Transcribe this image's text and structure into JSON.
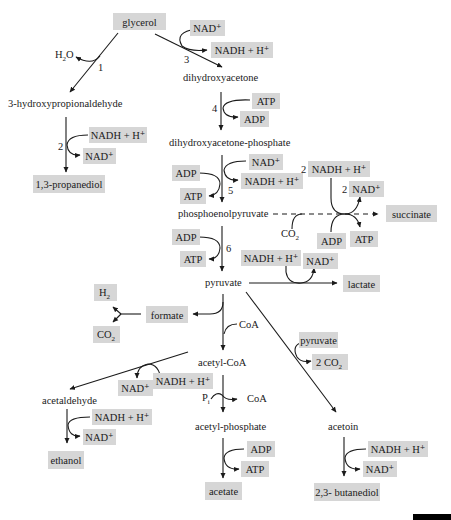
{
  "diagram": {
    "colors": {
      "box_fill": "#d6d6d6",
      "line": "#1a1a1a",
      "background": "#ffffff",
      "scale_bar": "#000000"
    },
    "nodes": {
      "glycerol": "glycerol",
      "hpa": "3-hydroxypropionaldehyde",
      "propanediol": "1,3-propanediol",
      "dha": "dihydroxyacetone",
      "dhap": "dihydroxyacetone-phosphate",
      "pep": "phosphoenolpyruvate",
      "succinate": "succinate",
      "pyruvate": "pyruvate",
      "lactate": "lactate",
      "formate": "formate",
      "h2": "H",
      "h2_sub": "2",
      "co2_formate": "CO",
      "co2_formate_sub": "2",
      "acetyl_coa": "acetyl-CoA",
      "acetaldehyde": "acetaldehyde",
      "ethanol": "ethanol",
      "acetyl_phosphate": "acetyl-phosphate",
      "acetate": "acetate",
      "acetoin": "acetoin",
      "butanediol": "2,3- butanediol"
    },
    "cofactors": {
      "h2o": "H",
      "h2o_sub": "2",
      "h2o_o": "O",
      "r2_in": "NADH + H⁺",
      "r2_out": "NAD⁺",
      "r3_in": "NAD⁺",
      "r3_out": "NADH + H⁺",
      "r4_in": "ATP",
      "r4_out": "ADP",
      "r5_nad_in": "NAD⁺",
      "r5_nadh_out": "NADH + H⁺",
      "r5_adp_in": "ADP",
      "r5_atp_out": "ATP",
      "succ_nadh": "NADH + H⁺",
      "succ_nadh_coef": "2",
      "succ_nad": "NAD⁺",
      "succ_nad_coef": "2",
      "succ_co2": "CO",
      "succ_co2_sub": "2",
      "succ_adp": "ADP",
      "succ_atp": "ATP",
      "r6_adp": "ADP",
      "r6_atp": "ATP",
      "lac_nadh": "NADH + H⁺",
      "lac_nad": "NAD⁺",
      "coa_in": "CoA",
      "acald_nadh": "NADH + H⁺",
      "acald_nad": "NAD⁺",
      "pi": "P",
      "pi_sub": "i",
      "coa_out": "CoA",
      "eth_nadh": "NADH + H⁺",
      "eth_nad": "NAD⁺",
      "ace_adp": "ADP",
      "ace_atp": "ATP",
      "acetoin_pyruvate": "pyruvate",
      "acetoin_co2": "2 CO",
      "acetoin_co2_sub": "2",
      "bdo_nadh": "NADH + H⁺",
      "bdo_nad": "NAD⁺"
    },
    "step_numbers": {
      "s1": "1",
      "s2": "2",
      "s3": "3",
      "s4": "4",
      "s5": "5",
      "s6": "6"
    }
  }
}
